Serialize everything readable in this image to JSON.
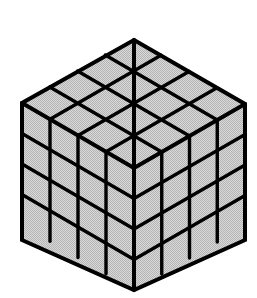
{
  "figure": {
    "kind": "isometric-cube-diagram",
    "caption": ""
  },
  "cube": {
    "divisions": 4,
    "unit_cubes_total": 64,
    "visible_faces": [
      "top",
      "left",
      "right"
    ],
    "cells_per_face": 16,
    "geometry": {
      "top_apex": [
        134,
        40
      ],
      "left_corner": [
        22,
        103
      ],
      "right_corner": [
        245,
        104
      ],
      "center_vertex": [
        134,
        168
      ],
      "bottom_left_corner": [
        22,
        240
      ],
      "bottom_right_corner": [
        245,
        240
      ],
      "bottom_apex": [
        134,
        290
      ]
    }
  },
  "style": {
    "background_color": "#ffffff",
    "face_fill_color": "#cfcfcf",
    "face_fill_pattern": "halftone-dither-gray",
    "outline_color": "#000000",
    "outline_width": 4,
    "grid_line_color": "#000000",
    "grid_line_width": 3.4
  }
}
